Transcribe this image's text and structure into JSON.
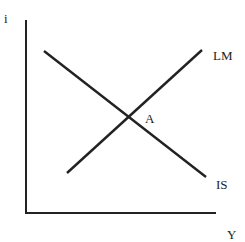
{
  "diagram": {
    "axes": {
      "y_label": "i",
      "x_label": "Y",
      "origin": [
        26,
        213
      ],
      "y_top": [
        26,
        20
      ],
      "x_right": [
        216,
        213
      ]
    },
    "curves": [
      {
        "name": "IS",
        "label": "IS",
        "start": [
          44,
          51
        ],
        "end": [
          206,
          177
        ],
        "slope": "downward"
      },
      {
        "name": "LM",
        "label": "LM",
        "start": [
          67,
          173
        ],
        "end": [
          202,
          50
        ],
        "slope": "upward"
      }
    ],
    "points": [
      {
        "name": "A",
        "label": "A",
        "position": [
          129,
          117
        ]
      }
    ],
    "colors": {
      "line": "#222222",
      "background": "#ffffff"
    }
  }
}
